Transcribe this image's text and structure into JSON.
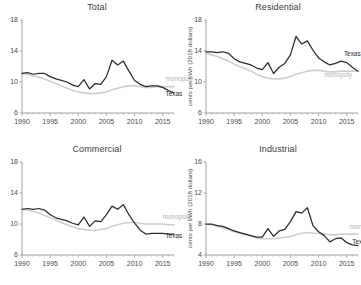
{
  "figure": {
    "background": "#ffffff",
    "panel_order": [
      "total",
      "residential",
      "commercial",
      "industrial"
    ]
  },
  "colors": {
    "texas": "#2b2b2b",
    "monopoly": "#cfcfcf",
    "axis": "#8a8a8a",
    "text": "#3c3c3c"
  },
  "titles": {
    "total": "Total",
    "residential": "Residential",
    "commercial": "Commercial",
    "industrial": "Industrial"
  },
  "axis_labels": {
    "y_residential": "cents per kWh (2018 dollars)",
    "y_industrial": "cents per kWh (2018 dollars)"
  },
  "series_labels": {
    "texas": "Texas",
    "monopoly": "monopoly",
    "monopoly_clipped": "monop"
  },
  "xticks": [
    "1990",
    "1995",
    "2000",
    "2005",
    "2010",
    "2015"
  ],
  "yticks": {
    "total": [
      "18",
      "14",
      "10",
      "6"
    ],
    "residential": [
      "18",
      "14",
      "10",
      "6"
    ],
    "commercial": [
      "18",
      "14",
      "10",
      "6"
    ],
    "industrial": [
      "16",
      "12",
      "8",
      "4"
    ]
  },
  "chart_data": [
    {
      "type": "line",
      "id": "total",
      "title": "Total",
      "xlabel": "",
      "ylabel": "",
      "xlim": [
        1990,
        2017
      ],
      "ylim": [
        6,
        18
      ],
      "grid": false,
      "legend": "inline-annotation",
      "x": [
        1990,
        1991,
        1992,
        1993,
        1994,
        1995,
        1996,
        1997,
        1998,
        1999,
        2000,
        2001,
        2002,
        2003,
        2004,
        2005,
        2006,
        2007,
        2008,
        2009,
        2010,
        2011,
        2012,
        2013,
        2014,
        2015,
        2016,
        2017
      ],
      "series": [
        {
          "name": "Texas",
          "color": "#2b2b2b",
          "values": [
            11.1,
            11.2,
            11.0,
            11.1,
            11.1,
            10.7,
            10.4,
            10.2,
            10.0,
            9.6,
            9.4,
            10.3,
            9.1,
            9.8,
            9.7,
            10.7,
            12.8,
            12.2,
            12.7,
            11.4,
            10.2,
            9.7,
            9.4,
            9.5,
            9.5,
            9.3,
            8.9,
            8.6
          ]
        },
        {
          "name": "monopoly",
          "color": "#cfcfcf",
          "values": [
            11.1,
            11.0,
            10.8,
            10.6,
            10.4,
            10.1,
            9.8,
            9.5,
            9.2,
            8.9,
            8.7,
            8.6,
            8.5,
            8.5,
            8.6,
            8.7,
            9.0,
            9.2,
            9.4,
            9.5,
            9.5,
            9.4,
            9.3,
            9.3,
            9.4,
            9.4,
            9.4,
            9.4
          ]
        }
      ],
      "annotations": [
        {
          "text": "monopoly",
          "series": "monopoly",
          "x": 2015.5,
          "y": 10.1
        },
        {
          "text": "Texas",
          "series": "Texas",
          "x": 2015.5,
          "y": 8.2
        }
      ]
    },
    {
      "type": "line",
      "id": "residential",
      "title": "Residential",
      "xlabel": "",
      "ylabel": "cents per kWh (2018 dollars)",
      "xlim": [
        1990,
        2017
      ],
      "ylim": [
        6,
        18
      ],
      "grid": false,
      "legend": "inline-annotation",
      "x": [
        1990,
        1991,
        1992,
        1993,
        1994,
        1995,
        1996,
        1997,
        1998,
        1999,
        2000,
        2001,
        2002,
        2003,
        2004,
        2005,
        2006,
        2007,
        2008,
        2009,
        2010,
        2011,
        2012,
        2013,
        2014,
        2015,
        2016,
        2017
      ],
      "series": [
        {
          "name": "Texas",
          "color": "#2b2b2b",
          "values": [
            13.9,
            13.9,
            13.8,
            13.9,
            13.7,
            13.0,
            12.6,
            12.4,
            12.2,
            11.8,
            11.6,
            12.5,
            11.1,
            11.9,
            12.4,
            13.5,
            15.9,
            14.9,
            15.3,
            14.1,
            13.1,
            12.6,
            12.2,
            12.4,
            12.7,
            12.5,
            11.9,
            11.4
          ]
        },
        {
          "name": "monopoly",
          "color": "#cfcfcf",
          "values": [
            13.7,
            13.5,
            13.3,
            13.0,
            12.7,
            12.3,
            12.0,
            11.7,
            11.4,
            11.0,
            10.7,
            10.5,
            10.4,
            10.4,
            10.5,
            10.7,
            11.0,
            11.2,
            11.4,
            11.5,
            11.5,
            11.4,
            11.3,
            11.3,
            11.4,
            11.4,
            11.4,
            11.4
          ]
        }
      ],
      "annotations": [
        {
          "text": "Texas",
          "series": "Texas",
          "x": 2014.5,
          "y": 13.4
        },
        {
          "text": "monopoly",
          "series": "monopoly",
          "x": 2011.0,
          "y": 10.6
        }
      ]
    },
    {
      "type": "line",
      "id": "commercial",
      "title": "Commercial",
      "xlabel": "",
      "ylabel": "",
      "xlim": [
        1990,
        2017
      ],
      "ylim": [
        6,
        18
      ],
      "grid": false,
      "legend": "inline-annotation",
      "x": [
        1990,
        1991,
        1992,
        1993,
        1994,
        1995,
        1996,
        1997,
        1998,
        1999,
        2000,
        2001,
        2002,
        2003,
        2004,
        2005,
        2006,
        2007,
        2008,
        2009,
        2010,
        2011,
        2012,
        2013,
        2014,
        2015,
        2016,
        2017
      ],
      "series": [
        {
          "name": "Texas",
          "color": "#2b2b2b",
          "values": [
            11.9,
            12.0,
            11.9,
            12.0,
            11.8,
            11.2,
            10.8,
            10.6,
            10.4,
            10.1,
            9.9,
            10.9,
            9.7,
            10.4,
            10.3,
            11.2,
            12.3,
            11.9,
            12.5,
            11.2,
            10.1,
            9.2,
            8.7,
            8.8,
            8.8,
            8.8,
            8.7,
            8.7
          ]
        },
        {
          "name": "monopoly",
          "color": "#cfcfcf",
          "values": [
            11.9,
            11.8,
            11.6,
            11.4,
            11.1,
            10.8,
            10.5,
            10.2,
            9.9,
            9.6,
            9.4,
            9.3,
            9.2,
            9.2,
            9.3,
            9.4,
            9.7,
            9.9,
            10.1,
            10.2,
            10.2,
            10.1,
            10.0,
            10.0,
            10.0,
            10.0,
            9.9,
            9.9
          ]
        }
      ],
      "annotations": [
        {
          "text": "monopoly",
          "series": "monopoly",
          "x": 2015.0,
          "y": 10.6
        },
        {
          "text": "Texas",
          "series": "Texas",
          "x": 2015.5,
          "y": 8.2
        }
      ]
    },
    {
      "type": "line",
      "id": "industrial",
      "title": "Industrial",
      "xlabel": "",
      "ylabel": "cents per kWh (2018 dollars)",
      "xlim": [
        1990,
        2017
      ],
      "ylim": [
        4,
        16
      ],
      "grid": false,
      "legend": "inline-annotation",
      "x": [
        1990,
        1991,
        1992,
        1993,
        1994,
        1995,
        1996,
        1997,
        1998,
        1999,
        2000,
        2001,
        2002,
        2003,
        2004,
        2005,
        2006,
        2007,
        2008,
        2009,
        2010,
        2011,
        2012,
        2013,
        2014,
        2015,
        2016,
        2017
      ],
      "series": [
        {
          "name": "Texas",
          "color": "#2b2b2b",
          "values": [
            8.0,
            8.0,
            7.8,
            7.7,
            7.4,
            7.1,
            6.9,
            6.7,
            6.5,
            6.3,
            6.3,
            7.4,
            6.4,
            7.1,
            7.3,
            8.3,
            9.6,
            9.4,
            10.1,
            7.8,
            7.0,
            6.5,
            5.7,
            6.1,
            6.2,
            5.6,
            5.3,
            5.2
          ]
        },
        {
          "name": "monopoly",
          "color": "#cfcfcf",
          "values": [
            8.0,
            7.9,
            7.7,
            7.5,
            7.3,
            7.0,
            6.8,
            6.6,
            6.4,
            6.2,
            6.1,
            6.1,
            6.1,
            6.2,
            6.3,
            6.4,
            6.6,
            6.8,
            6.9,
            6.8,
            6.8,
            6.7,
            6.6,
            6.6,
            6.7,
            6.7,
            6.7,
            6.7
          ]
        }
      ],
      "annotations": [
        {
          "text": "monop",
          "series": "monopoly",
          "x": 2015.5,
          "y": 7.3
        },
        {
          "text": "Texas",
          "series": "Texas",
          "x": 2016.0,
          "y": 5.4
        }
      ]
    }
  ]
}
